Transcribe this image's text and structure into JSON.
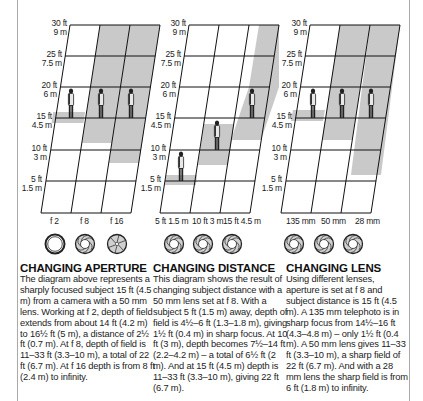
{
  "panels": [
    {
      "id": "aperture",
      "title": "CHANGING APERTURE",
      "body": "The diagram above represents a sharply focused subject 15 ft (4.5 m) from a camera with a 50 mm lens. Working at f 2, depth of field extends from about 14 ft (4.2 m) to 16½ ft (5 m), a distance of 2½ ft (0.7 m). At f 8, depth of field is 11–33 ft (3.3–10 m), a total of 22 ft (6.7 m). At f 16 depth is from 8 ft (2.4 m) to infinity.",
      "columns": [
        "f 2",
        "f 8",
        "f 16"
      ],
      "icons": [
        "aperture-wide-open-icon",
        "aperture-medium-icon",
        "aperture-small-icon"
      ]
    },
    {
      "id": "distance",
      "title": "CHANGING DISTANCE",
      "body": "This diagram shows the result of changing subject distance with a 50 mm lens set at f 8. With a subject 5 ft (1.5 m) away, depth of field is 4½–6 ft (1.3–1.8 m), giving 1½ ft (0.4 m) in sharp focus. At 10 ft (3 m), depth becomes 7½–14 ft (2.2–4.2 m) – a total of 6½ ft (2 m). And at 15 ft (4.5 m) depth is 11–33 ft (3.3–10 m), giving 22 ft (6.7 m).",
      "columns": [
        "5 ft 1.5 m",
        "10 ft 3 m",
        "15 ft 4.5 m"
      ],
      "icons": [
        "aperture-f8-icon",
        "aperture-f8-icon",
        "aperture-f8-icon"
      ]
    },
    {
      "id": "lens",
      "title": "CHANGING LENS",
      "body": "Using different lenses, aperture is set at f 8 and subject distance is 15 ft (4.5 m). A 135 mm telephoto is in sharp focus from 14½–16 ft (4.3–4.8 m) – only 1½ ft (0.4 m). A 50 mm lens gives 11–33 ft (3.3–10 m), a sharp field of 22 ft (6.7 m). And with a 28 mm lens the sharp field is from 6 ft (1.8 m) to infinity.",
      "columns": [
        "135 mm",
        "50 mm",
        "28 mm"
      ],
      "icons": [
        "aperture-f8-icon",
        "aperture-f8-icon",
        "aperture-f8-icon"
      ]
    }
  ],
  "distance_scale": [
    {
      "ft": "30 ft",
      "m": "9 m"
    },
    {
      "ft": "25 ft",
      "m": "7.5 m"
    },
    {
      "ft": "20 ft",
      "m": "6 m"
    },
    {
      "ft": "15 ft",
      "m": "4.5 m"
    },
    {
      "ft": "10 ft",
      "m": "3 m"
    },
    {
      "ft": "5 ft",
      "m": "1.5 m"
    }
  ],
  "depth_of_field_ft": {
    "aperture": [
      [
        14,
        16.5
      ],
      [
        11,
        33
      ],
      [
        8,
        "infinity"
      ]
    ],
    "distance": [
      [
        4.5,
        6
      ],
      [
        7.5,
        14
      ],
      [
        11,
        33
      ]
    ],
    "lens": [
      [
        14.5,
        16
      ],
      [
        11,
        33
      ],
      [
        6,
        "infinity"
      ]
    ]
  },
  "colors": {
    "shade": "#c9c9c9",
    "grid_line": "#111111",
    "border": "#aaaaaa"
  }
}
